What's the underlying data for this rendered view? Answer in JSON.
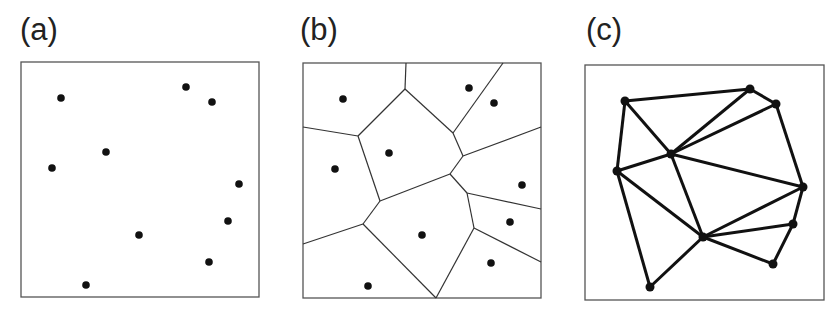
{
  "figure": {
    "colors": {
      "background": "#ffffff",
      "stroke": "#333333",
      "point": "#111111"
    },
    "panels": [
      {
        "id": "a",
        "label": "(a)",
        "label_pos": [
          20,
          14
        ],
        "kind": "points",
        "box": [
          21,
          62,
          259,
          297
        ],
        "points": [
          [
            61,
            98
          ],
          [
            186,
            87
          ],
          [
            212,
            102
          ],
          [
            106,
            152
          ],
          [
            52,
            168
          ],
          [
            239,
            184
          ],
          [
            228,
            221
          ],
          [
            139,
            235
          ],
          [
            209,
            262
          ],
          [
            86,
            285
          ]
        ]
      },
      {
        "id": "b",
        "label": "(b)",
        "label_pos": [
          300,
          14
        ],
        "kind": "voronoi",
        "box": [
          303,
          63,
          541,
          298
        ],
        "points": [
          [
            343,
            99
          ],
          [
            469,
            88
          ],
          [
            494,
            103
          ],
          [
            389,
            153
          ],
          [
            335,
            169
          ],
          [
            522,
            185
          ],
          [
            510,
            222
          ],
          [
            422,
            235
          ],
          [
            491,
            263
          ],
          [
            368,
            286
          ]
        ],
        "edges": [
          [
            [
              406,
              63
            ],
            [
              405,
              89
            ]
          ],
          [
            [
              405,
              89
            ],
            [
              358,
              136
            ]
          ],
          [
            [
              405,
              89
            ],
            [
              453,
              133
            ]
          ],
          [
            [
              303,
              127
            ],
            [
              358,
              136
            ]
          ],
          [
            [
              358,
              136
            ],
            [
              380,
              201
            ]
          ],
          [
            [
              503,
              63
            ],
            [
              453,
              133
            ]
          ],
          [
            [
              453,
              133
            ],
            [
              463,
              156
            ]
          ],
          [
            [
              463,
              156
            ],
            [
              541,
              127
            ]
          ],
          [
            [
              463,
              156
            ],
            [
              450,
              174
            ]
          ],
          [
            [
              450,
              174
            ],
            [
              380,
              201
            ]
          ],
          [
            [
              450,
              174
            ],
            [
              467,
              193
            ]
          ],
          [
            [
              467,
              193
            ],
            [
              541,
              209
            ]
          ],
          [
            [
              467,
              193
            ],
            [
              474,
              228
            ]
          ],
          [
            [
              474,
              228
            ],
            [
              541,
              262
            ]
          ],
          [
            [
              474,
              228
            ],
            [
              436,
              298
            ]
          ],
          [
            [
              380,
              201
            ],
            [
              363,
              224
            ]
          ],
          [
            [
              363,
              224
            ],
            [
              303,
              244
            ]
          ],
          [
            [
              363,
              224
            ],
            [
              436,
              298
            ]
          ]
        ]
      },
      {
        "id": "c",
        "label": "(c)",
        "label_pos": [
          586,
          14
        ],
        "kind": "delaunay",
        "box": [
          585,
          65,
          824,
          300
        ],
        "points": [
          [
            625,
            101
          ],
          [
            750,
            89
          ],
          [
            776,
            104
          ],
          [
            671,
            154
          ],
          [
            617,
            171
          ],
          [
            803,
            187
          ],
          [
            793,
            224
          ],
          [
            703,
            237
          ],
          [
            773,
            264
          ],
          [
            650,
            287
          ]
        ],
        "edges": [
          [
            0,
            1
          ],
          [
            1,
            2
          ],
          [
            0,
            3
          ],
          [
            0,
            4
          ],
          [
            1,
            3
          ],
          [
            2,
            3
          ],
          [
            2,
            5
          ],
          [
            3,
            4
          ],
          [
            3,
            5
          ],
          [
            3,
            7
          ],
          [
            4,
            7
          ],
          [
            4,
            9
          ],
          [
            5,
            6
          ],
          [
            5,
            7
          ],
          [
            6,
            7
          ],
          [
            6,
            8
          ],
          [
            7,
            8
          ],
          [
            7,
            9
          ]
        ]
      }
    ]
  }
}
